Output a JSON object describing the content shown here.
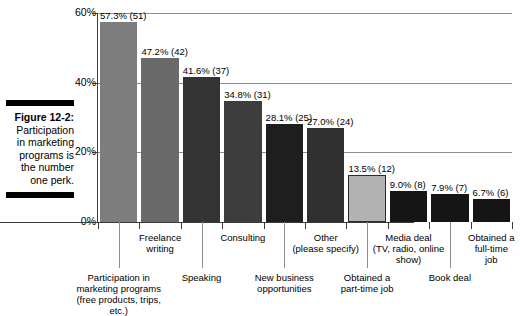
{
  "figure": {
    "label": "Figure 12-2:",
    "caption": "Participation in marketing programs is the number one perk."
  },
  "chart_data": {
    "type": "bar",
    "title": "",
    "xlabel": "",
    "ylabel": "",
    "ylim": [
      0,
      60
    ],
    "grid": true,
    "legend": "none",
    "yticks": [
      "0%",
      "20%",
      "40%",
      "60%"
    ],
    "ytick_values": [
      0,
      20,
      40,
      60
    ],
    "categories": [
      "Participation in marketing programs (free products, trips, etc.)",
      "Freelance writing",
      "Speaking",
      "Consulting",
      "New business opportunities",
      "Other (please specify)",
      "Obtained a part-time job",
      "Media deal (TV, radio, online show)",
      "Book deal",
      "Obtained a full-time job"
    ],
    "values": [
      57.3,
      47.2,
      41.6,
      34.8,
      28.1,
      27.0,
      13.5,
      9.0,
      7.9,
      6.7
    ],
    "counts": [
      51,
      42,
      37,
      31,
      25,
      24,
      12,
      8,
      7,
      6
    ],
    "data_labels": [
      "57.3% (51)",
      "47.2% (42)",
      "41.6% (37)",
      "34.8% (31)",
      "28.1% (25)",
      "27.0% (24)",
      "13.5% (12)",
      "9.0% (8)",
      "7.9% (7)",
      "6.7% (6)"
    ],
    "bar_colors": [
      "#7d7d7d",
      "#6a6a6a",
      "#333333",
      "#3d3d3d",
      "#1e1e1e",
      "#303030",
      "#b3b3b3",
      "#151515",
      "#151515",
      "#151515"
    ]
  },
  "axis_labels": {
    "row_top": [
      {
        "text": "Freelance\nwriting",
        "index": 1
      },
      {
        "text": "Consulting",
        "index": 3
      },
      {
        "text": "Other\n(please specify)",
        "index": 5
      },
      {
        "text": "Media deal\n(TV, radio, online\nshow)",
        "index": 7
      },
      {
        "text": "Obtained a\nfull-time\njob",
        "index": 9
      }
    ],
    "row_bottom": [
      {
        "text": "Participation in\nmarketing programs\n(free products, trips, etc.)",
        "index": 0
      },
      {
        "text": "Speaking",
        "index": 2
      },
      {
        "text": "New business\nopportunities",
        "index": 4
      },
      {
        "text": "Obtained a\npart-time job",
        "index": 6
      },
      {
        "text": "Book deal",
        "index": 8
      }
    ]
  }
}
